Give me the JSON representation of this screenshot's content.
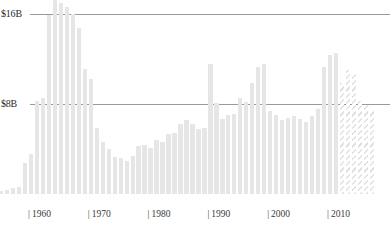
{
  "chart_data": {
    "type": "bar",
    "title": "",
    "subtitle": "",
    "xlabel": "",
    "ylabel": "",
    "ylim": [
      0,
      17.5
    ],
    "xlim": [
      1955,
      2018
    ],
    "grid": true,
    "legend": null,
    "y_tick_labels": [
      "$16B",
      "$8B"
    ],
    "y_tick_values": [
      16,
      8
    ],
    "x_tick_labels": [
      "1960",
      "1970",
      "1980",
      "1990",
      "2000",
      "2010"
    ],
    "x_tick_values": [
      1960,
      1970,
      1980,
      1990,
      2000,
      2010
    ],
    "series_name": "Value",
    "bar_color": "#e6e6e6",
    "projection_note": "hatched bars indicate projected values",
    "categories": [
      1955,
      1956,
      1957,
      1958,
      1959,
      1960,
      1961,
      1962,
      1963,
      1964,
      1965,
      1966,
      1967,
      1968,
      1969,
      1970,
      1971,
      1972,
      1973,
      1974,
      1975,
      1976,
      1977,
      1978,
      1979,
      1980,
      1981,
      1982,
      1983,
      1984,
      1985,
      1986,
      1987,
      1988,
      1989,
      1990,
      1991,
      1992,
      1993,
      1994,
      1995,
      1996,
      1997,
      1998,
      1999,
      2000,
      2001,
      2002,
      2003,
      2004,
      2005,
      2006,
      2007,
      2008,
      2009,
      2010,
      2011,
      2012,
      2013,
      2014,
      2015,
      2016,
      2017
    ],
    "values": [
      0.3,
      0.4,
      0.5,
      0.6,
      2.8,
      3.6,
      8.3,
      8.5,
      15.9,
      17.3,
      17.0,
      16.6,
      16.0,
      14.8,
      11.1,
      10.2,
      5.9,
      4.6,
      4.0,
      3.3,
      3.2,
      2.9,
      3.4,
      4.3,
      4.4,
      4.1,
      4.8,
      4.6,
      5.3,
      5.4,
      6.2,
      6.6,
      6.2,
      5.8,
      5.9,
      11.6,
      8.1,
      6.7,
      7.0,
      7.1,
      8.5,
      8.2,
      9.9,
      11.3,
      11.6,
      7.4,
      7.0,
      6.6,
      6.8,
      6.9,
      6.7,
      6.4,
      6.9,
      7.6,
      11.3,
      12.4,
      12.5,
      9.9,
      11.0,
      10.8,
      8.3,
      7.9,
      7.5
    ],
    "projected_from": 2012,
    "projected_values": [
      {
        "year": 2012,
        "value": 7.6
      },
      {
        "year": 2013,
        "value": 7.6
      },
      {
        "year": 2014,
        "value": 7.6
      },
      {
        "year": 2015,
        "value": 7.6
      },
      {
        "year": 2016,
        "value": 7.6
      },
      {
        "year": 2017,
        "value": 7.6
      }
    ]
  }
}
